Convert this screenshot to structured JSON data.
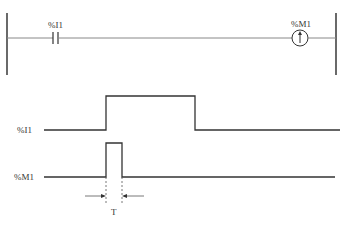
{
  "ladder": {
    "contact_label": "%I1",
    "coil_label": "%M1",
    "coil_symbol": "↑",
    "coil_type": "rising-edge coil"
  },
  "timing": {
    "signals": [
      {
        "label": "%I1",
        "type": "input"
      },
      {
        "label": "%M1",
        "type": "output"
      }
    ],
    "pulse_width_label": "T"
  },
  "colors": {
    "line": "#333333",
    "rail": "#444444",
    "rung": "#888888",
    "background": "#ffffff"
  }
}
